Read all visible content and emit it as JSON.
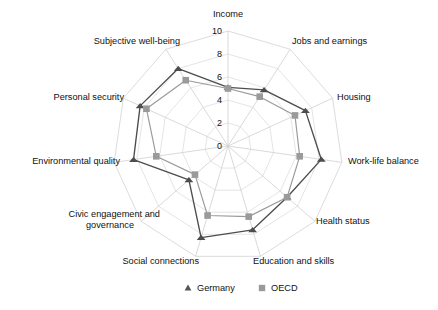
{
  "chart_data": {
    "type": "radar",
    "title": "",
    "subtitle": "",
    "xlabel": "",
    "ylabel": "",
    "grid": true,
    "legend_position": "bottom",
    "radial_axis": {
      "min": 0,
      "max": 10,
      "ticks": [
        0,
        2,
        4,
        6,
        8,
        10
      ],
      "tick_labels": [
        "0",
        "2",
        "4",
        "6",
        "8",
        "10"
      ],
      "tick_axis_category": "Income"
    },
    "categories": [
      "Income",
      "Jobs and earnings",
      "Housing",
      "Work-life balance",
      "Health status",
      "Education and skills",
      "Social connections",
      "Civic engagement and governance",
      "Environmental quality",
      "Personal security",
      "Subjective well-being"
    ],
    "series": [
      {
        "name": "Germany",
        "marker": "triangle",
        "color": "#4d4d4d",
        "values": [
          5.1,
          5.8,
          7.4,
          8.2,
          6.8,
          7.6,
          8.3,
          4.5,
          8.3,
          8.4,
          8.0
        ]
      },
      {
        "name": "OECD",
        "marker": "square",
        "color": "#9a9a9a",
        "values": [
          5.0,
          5.1,
          6.4,
          6.3,
          6.8,
          6.4,
          6.3,
          3.8,
          6.3,
          7.8,
          6.8
        ]
      }
    ]
  },
  "legend": {
    "items": [
      {
        "label": "Germany",
        "marker": "triangle",
        "color": "#555555"
      },
      {
        "label": "OECD",
        "marker": "square",
        "color": "#9a9a9a"
      }
    ]
  },
  "colors": {
    "germany": "#4d4d4d",
    "oecd": "#9a9a9a",
    "grid": "#d8d8d8",
    "spoke": "#cfcfcf",
    "text": "#111111",
    "background": "#ffffff"
  },
  "category_labels": {
    "income": "Income",
    "jobs_and_earnings": "Jobs and earnings",
    "housing": "Housing",
    "work_life_balance": "Work-life balance",
    "health_status": "Health status",
    "education_and_skills": "Education and skills",
    "social_connections": "Social connections",
    "civic_engagement_line1": "Civic engagement and",
    "civic_engagement_line2": "governance",
    "environmental_quality": "Environmental quality",
    "personal_security": "Subjective well-being",
    "subjective_well_being": "Subjective well-being",
    "personal_security_label": "Personal security"
  },
  "tick_labels": {
    "t0": "0",
    "t2": "2",
    "t4": "4",
    "t6": "6",
    "t8": "8",
    "t10": "10"
  }
}
